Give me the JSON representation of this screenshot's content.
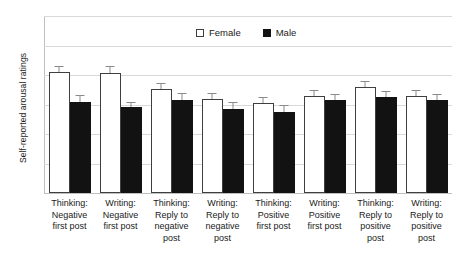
{
  "chart_data": {
    "type": "bar",
    "title": "",
    "xlabel": "",
    "ylabel": "Self-reported arousal ratings",
    "ylim": [
      1,
      7
    ],
    "yticks": [
      1,
      2,
      3,
      4,
      5,
      6,
      7
    ],
    "grid": true,
    "legend_position": "top-center",
    "categories": [
      "Thinking: Negative first post",
      "Writing: Negative first post",
      "Thinking: Reply to negative post",
      "Writing: Reply to negative post",
      "Thinking: Positive first post",
      "Writing: Positive first post",
      "Thinking: Reply to positive post",
      "Writing: Reply to positive post"
    ],
    "category_lines": [
      [
        "Thinking:",
        "Negative",
        "first post"
      ],
      [
        "Writing:",
        "Negative",
        "first post"
      ],
      [
        "Thinking:",
        "Reply to",
        "negative",
        "post"
      ],
      [
        "Writing:",
        "Reply to",
        "negative",
        "post"
      ],
      [
        "Thinking:",
        "Positive",
        "first post"
      ],
      [
        "Writing:",
        "Positive",
        "first post"
      ],
      [
        "Thinking:",
        "Reply to",
        "positive",
        "post"
      ],
      [
        "Writing:",
        "Reply to",
        "positive",
        "post"
      ]
    ],
    "series": [
      {
        "name": "Female",
        "color": "#ffffff",
        "edge_color": "#3f3f3f",
        "values": [
          5.1,
          5.08,
          4.52,
          4.18,
          4.05,
          4.3,
          4.6,
          4.3
        ],
        "errors": [
          0.22,
          0.22,
          0.2,
          0.2,
          0.2,
          0.18,
          0.18,
          0.18
        ]
      },
      {
        "name": "Male",
        "color": "#121212",
        "edge_color": "#121212",
        "values": [
          4.1,
          3.9,
          4.15,
          3.85,
          3.76,
          4.15,
          4.25,
          4.15
        ],
        "errors": [
          0.22,
          0.2,
          0.25,
          0.22,
          0.22,
          0.2,
          0.2,
          0.22
        ]
      }
    ]
  },
  "legend": {
    "items": [
      {
        "label": "Female",
        "swatch": "open-square"
      },
      {
        "label": "Male",
        "swatch": "filled-square"
      }
    ]
  },
  "colors": {
    "female_fill": "#ffffff",
    "male_fill": "#121212",
    "gridline": "#d9d9d9",
    "axis": "#bfbfbf",
    "error_bar": "#8a8a8a",
    "text": "#1a1a1a",
    "background": "#ffffff"
  }
}
